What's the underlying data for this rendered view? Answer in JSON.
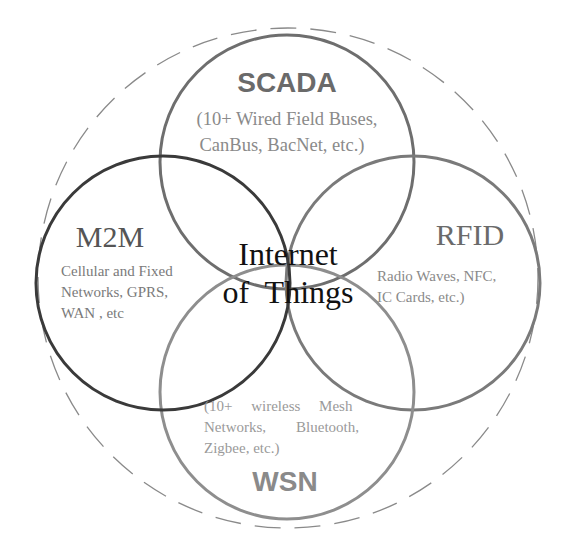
{
  "diagram": {
    "center": {
      "line1": "Internet",
      "line2": "of  Things"
    },
    "scada": {
      "title": "SCADA",
      "desc_line1": "(10+ Wired Field Buses,",
      "desc_line2": "CanBus, BacNet, etc.)"
    },
    "m2m": {
      "title": "M2M",
      "desc_line1": "Cellular and Fixed",
      "desc_line2": "Networks,  GPRS,",
      "desc_line3": "WAN , etc"
    },
    "rfid": {
      "title": "RFID",
      "desc_line1": "Radio  Waves,  NFC,",
      "desc_line2": "IC Cards, etc.)"
    },
    "wsn": {
      "title": "WSN",
      "desc_line1": "(10+     wireless     Mesh",
      "desc_line2": "Networks,        Bluetooth,",
      "desc_line3": "Zigbee, etc.)"
    },
    "colors": {
      "scada_stroke": "#6e6e6e",
      "m2m_stroke": "#3a3a3a",
      "rfid_stroke": "#7a7a7a",
      "wsn_stroke": "#8e8e8e",
      "outer_dashed": "#8a8a8a",
      "center_text": "#111111",
      "title_text": "#6a6a6a",
      "desc_text": "#8a8a8a"
    }
  }
}
